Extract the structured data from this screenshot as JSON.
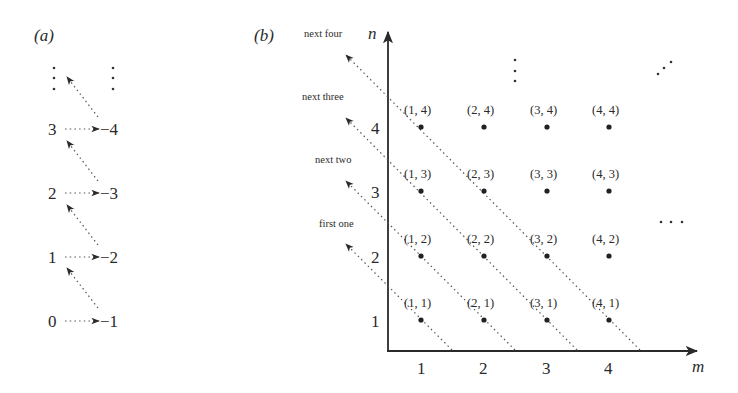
{
  "panel_a": {
    "label": "(a)",
    "left_column": [
      "0",
      "1",
      "2",
      "3"
    ],
    "right_column": [
      "−1",
      "−2",
      "−3",
      "−4"
    ],
    "continuation": "⋮"
  },
  "panel_b": {
    "label": "(b)",
    "axes": {
      "x": "m",
      "y": "n"
    },
    "x_ticks": [
      "1",
      "2",
      "3",
      "4"
    ],
    "y_ticks": [
      "1",
      "2",
      "3",
      "4"
    ],
    "points": [
      [
        "(1, 1)",
        "(2, 1)",
        "(3, 1)",
        "(4, 1)"
      ],
      [
        "(1, 2)",
        "(2, 2)",
        "(3, 2)",
        "(4, 2)"
      ],
      [
        "(1, 3)",
        "(2, 3)",
        "(3, 3)",
        "(4, 3)"
      ],
      [
        "(1, 4)",
        "(2, 4)",
        "(3, 4)",
        "(4, 4)"
      ]
    ],
    "diagonal_labels": [
      "first one",
      "next two",
      "next three",
      "next four"
    ],
    "ellipsis_vertical": "⋮",
    "ellipsis_horizontal": "…",
    "ellipsis_diagonal": "⋰"
  }
}
